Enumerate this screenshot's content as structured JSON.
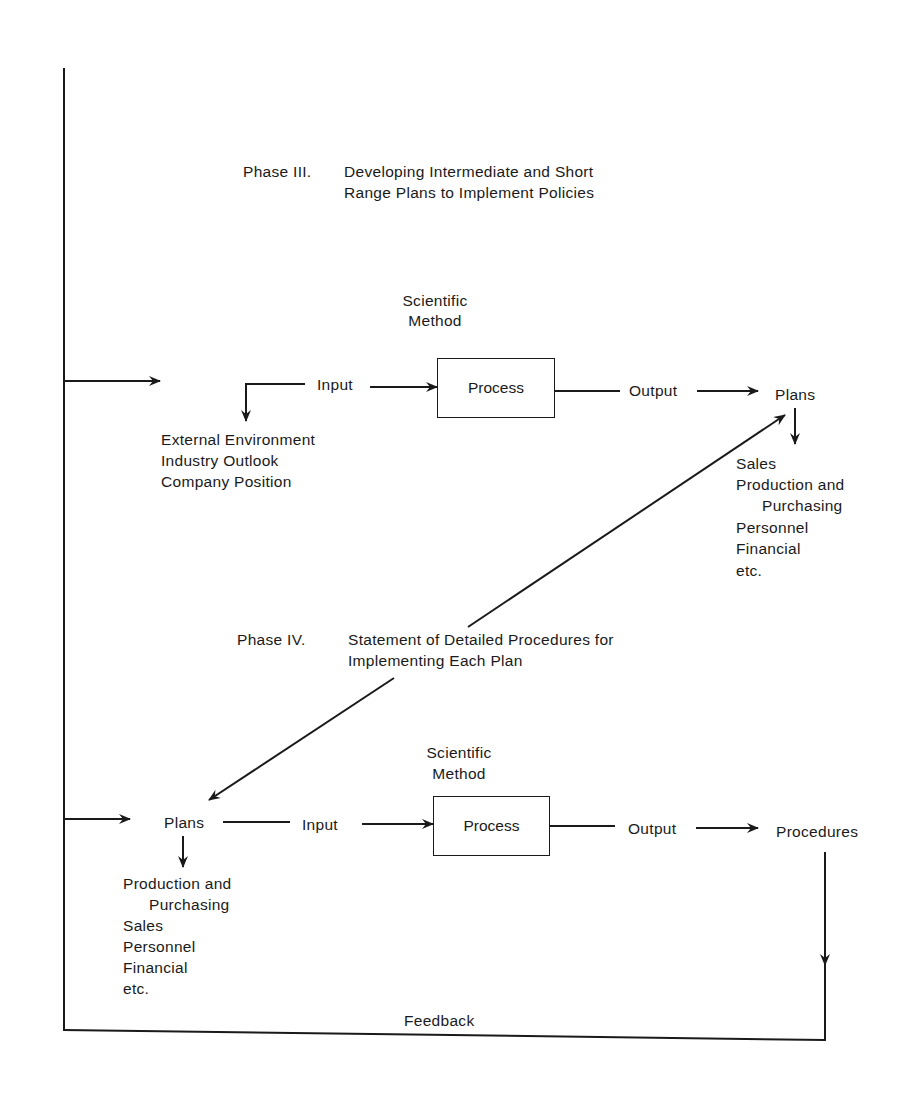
{
  "phase3": {
    "label": "Phase III.",
    "title_line1": "Developing Intermediate and Short",
    "title_line2": "Range Plans to Implement Policies",
    "method_line1": "Scientific",
    "method_line2": "Method",
    "input": "Input",
    "process": "Process",
    "output": "Output",
    "result": "Plans",
    "input_items": [
      "External Environment",
      "Industry Outlook",
      "Company Position"
    ],
    "output_items": [
      "Sales",
      "Production and",
      "Purchasing",
      "Personnel",
      "Financial",
      "etc."
    ]
  },
  "phase4": {
    "label": "Phase IV.",
    "title_line1": "Statement of Detailed Procedures for",
    "title_line2": "Implementing Each Plan",
    "method_line1": "Scientific",
    "method_line2": "Method",
    "source": "Plans",
    "input": "Input",
    "process": "Process",
    "output": "Output",
    "result": "Procedures",
    "source_items": [
      "Production and",
      "Purchasing",
      "Sales",
      "Personnel",
      "Financial",
      "etc."
    ]
  },
  "feedback": "Feedback",
  "colors": {
    "ink": "#1a1a1a",
    "background": "#ffffff"
  }
}
